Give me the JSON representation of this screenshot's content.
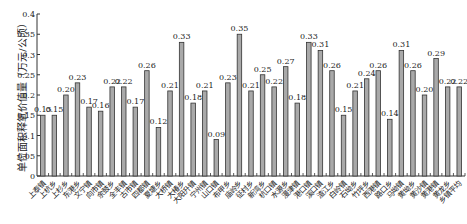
{
  "chart_data": {
    "type": "bar",
    "title": "",
    "xlabel": "",
    "ylabel": "单位面积释氧价值量（万元/公顷）",
    "ylim": [
      0,
      0.4
    ],
    "yticks": [
      "0",
      "0.05",
      "0.1",
      "0.15",
      "0.2",
      "0.25",
      "0.3",
      "0.35",
      "0.4"
    ],
    "grid": false,
    "legend": null,
    "bar_color": "#a9a9a9",
    "bar_edge_color": "#333333",
    "categories": [
      "上泰镇",
      "上杭乡",
      "上杉乡",
      "东港乡",
      "文宁镇",
      "向市镇",
      "余鼓乡",
      "全丰镇",
      "古市镇",
      "四都镇",
      "夏塘乡",
      "大桥镇",
      "大椿乡",
      "大阳升镇",
      "宁州镇",
      "山口镇",
      "布甲乡",
      "庙岭乡",
      "征村乡",
      "新湾乡",
      "杭口镇",
      "水源乡",
      "漫津镇",
      "港口镇",
      "溪口镇",
      "渣江乡",
      "白岭镇",
      "石坳乡",
      "竹坪乡",
      "西港镇",
      "路口乡",
      "马坳镇",
      "黄坳乡",
      "黄沙镇",
      "黄港镇",
      "黄龙乡",
      "乡镇平均"
    ],
    "values": [
      0.15,
      0.15,
      0.2,
      0.23,
      0.17,
      0.16,
      0.22,
      0.22,
      0.17,
      0.26,
      0.12,
      0.21,
      0.33,
      0.18,
      0.21,
      0.09,
      0.23,
      0.35,
      0.21,
      0.25,
      0.22,
      0.27,
      0.18,
      0.33,
      0.31,
      0.26,
      0.15,
      0.21,
      0.24,
      0.26,
      0.14,
      0.31,
      0.26,
      0.2,
      0.29,
      0.22,
      0.22
    ],
    "labels": [
      "0.15",
      "0.15",
      "0.20",
      "0.23",
      "0.17",
      "0.16",
      "0.22",
      "0.22",
      "0.17",
      "0.26",
      "0.12",
      "0.21",
      "0.33",
      "0.18",
      "0.21",
      "0.09",
      "0.23",
      "0.35",
      "0.21",
      "0.25",
      "0.22",
      "0.27",
      "0.18",
      "0.33",
      "0.31",
      "0.26",
      "0.15",
      "0.21",
      "0.24",
      "0.26",
      "0.14",
      "0.31",
      "0.26",
      "0.20",
      "0.29",
      "0.22",
      "0.22"
    ]
  }
}
